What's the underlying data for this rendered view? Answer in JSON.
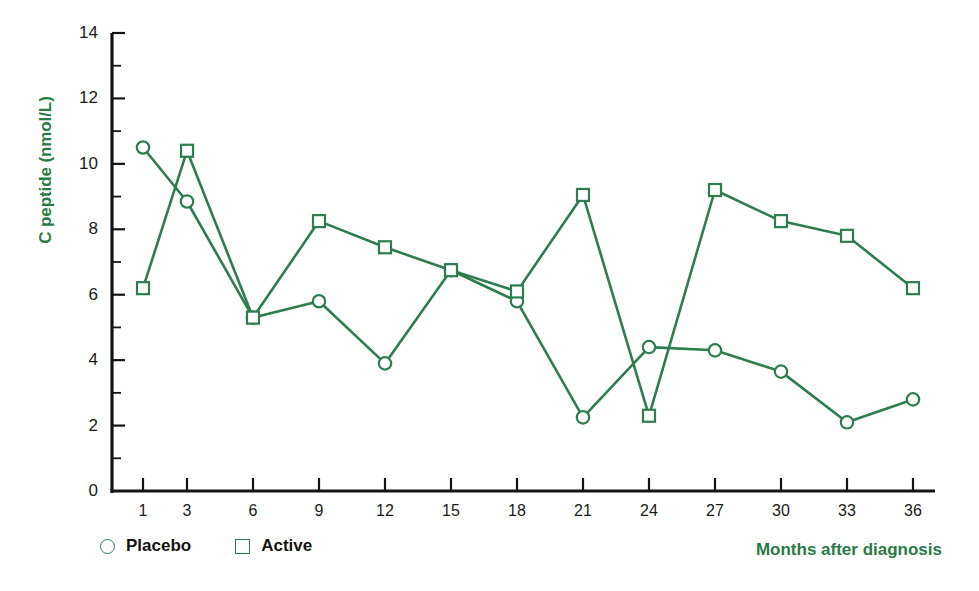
{
  "chart_data": {
    "type": "line",
    "title": "",
    "xlabel": "Months after diagnosis",
    "ylabel": "C peptide (nmol/L)",
    "x": [
      1,
      3,
      6,
      9,
      12,
      15,
      18,
      21,
      24,
      27,
      30,
      33,
      36
    ],
    "xtick_labels": [
      "1",
      "3",
      "6",
      "9",
      "12",
      "15",
      "18",
      "21",
      "24",
      "27",
      "30",
      "33",
      "36"
    ],
    "ytick_labels": [
      "0",
      "2",
      "4",
      "6",
      "8",
      "10",
      "12",
      "14"
    ],
    "ytick_values": [
      0,
      2,
      4,
      6,
      8,
      10,
      12,
      14
    ],
    "yminor_values": [
      1,
      3,
      5,
      7,
      9,
      11,
      13
    ],
    "ylim": [
      0,
      14
    ],
    "xlim": [
      1,
      36
    ],
    "grid": false,
    "legend_position": "bottom-left",
    "series": [
      {
        "name": "Placebo",
        "marker": "circle",
        "color": "#2e7d4f",
        "values": [
          10.5,
          8.85,
          5.3,
          5.8,
          3.9,
          6.75,
          5.8,
          2.25,
          4.4,
          4.3,
          3.65,
          2.1,
          2.8
        ]
      },
      {
        "name": "Active",
        "marker": "square",
        "color": "#2e7d4f",
        "values": [
          6.2,
          10.4,
          5.3,
          8.25,
          7.45,
          6.75,
          6.1,
          9.05,
          2.3,
          9.2,
          8.25,
          7.8,
          6.2
        ]
      }
    ]
  },
  "axis": {
    "ylabel_text": "C peptide (nmol/L)",
    "xcaption_text": "Months after diagnosis"
  },
  "legend": {
    "items": [
      {
        "label": "Placebo",
        "marker": "circle-marker-icon"
      },
      {
        "label": "Active",
        "marker": "square-marker-icon"
      }
    ]
  },
  "colors": {
    "series_green": "#2e7d4f",
    "label_green": "#2a7a46",
    "axis_black": "#141414",
    "tick_text": "#1a1a1a"
  }
}
